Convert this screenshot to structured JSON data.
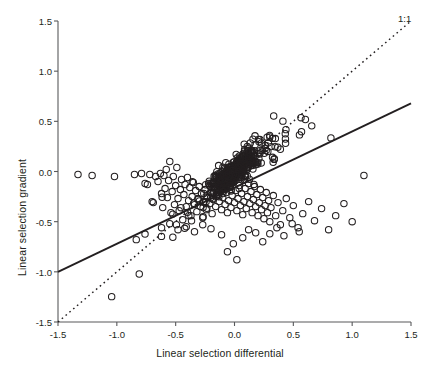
{
  "figure": {
    "background": "#ffffff",
    "ink": "#231f20",
    "axis_color": "#58595b",
    "point_stroke": "#231f20",
    "fit_line_color": "#231f20",
    "reference_line_color": "#231f20"
  },
  "annotations": {
    "one_to_one_label": "1:1"
  },
  "axes": {
    "x_label": "Linear selection differential",
    "y_label": "Linear selection gradient",
    "x_ticks": [
      "-1.5",
      "-1.0",
      "-0.5",
      "0.0",
      "0.5",
      "1.0",
      "1.5"
    ],
    "y_ticks": [
      "1.5",
      "1.0",
      "0.5",
      "0.0",
      "-0.5",
      "-1.0",
      "-1.5"
    ]
  },
  "chart_data": {
    "type": "scatter",
    "title": "",
    "xlabel": "Linear selection differential",
    "ylabel": "Linear selection gradient",
    "xlim": [
      -1.5,
      1.5
    ],
    "ylim": [
      -1.5,
      1.5
    ],
    "xticks": [
      -1.5,
      -1.0,
      -0.5,
      0.0,
      0.5,
      1.0,
      1.5
    ],
    "yticks": [
      -1.5,
      -1.0,
      -0.5,
      0.0,
      0.5,
      1.0,
      1.5
    ],
    "grid": false,
    "legend": false,
    "marker": "open-circle",
    "marker_size_px": 6.4,
    "lines": [
      {
        "name": "major-axis-fit",
        "style": "solid",
        "x": [
          -1.5,
          1.5
        ],
        "y": [
          -1.0,
          0.68
        ],
        "slope": 0.56,
        "intercept": -0.16
      },
      {
        "name": "one-to-one",
        "style": "dashed",
        "label": "1:1",
        "x": [
          -1.5,
          1.5
        ],
        "y": [
          -1.5,
          1.5
        ],
        "slope": 1.0,
        "intercept": 0.0
      }
    ],
    "n_points": 594,
    "points": [
      [
        -1.33,
        -0.03
      ],
      [
        -1.21,
        -0.04
      ],
      [
        -1.02,
        -0.05
      ],
      [
        -0.85,
        -0.03
      ],
      [
        -0.79,
        -0.02
      ],
      [
        -0.76,
        -0.12
      ],
      [
        -0.74,
        -0.13
      ],
      [
        -0.72,
        -0.03
      ],
      [
        -0.7,
        -0.3
      ],
      [
        -0.69,
        -0.31
      ],
      [
        -0.67,
        -0.05
      ],
      [
        -0.65,
        -0.1
      ],
      [
        -0.63,
        -0.02
      ],
      [
        -0.62,
        -0.22
      ],
      [
        -0.61,
        -0.36
      ],
      [
        -0.6,
        -0.04
      ],
      [
        -0.59,
        -0.17
      ],
      [
        -0.58,
        0.02
      ],
      [
        -0.57,
        -0.26
      ],
      [
        -0.56,
        -0.09
      ],
      [
        -0.55,
        0.1
      ],
      [
        -0.54,
        -0.41
      ],
      [
        -0.53,
        -0.2
      ],
      [
        -0.52,
        -0.05
      ],
      [
        -0.51,
        -0.33
      ],
      [
        -0.5,
        -0.14
      ],
      [
        -0.49,
        0.04
      ],
      [
        -0.48,
        -0.27
      ],
      [
        -0.47,
        -0.39
      ],
      [
        -0.46,
        -0.18
      ],
      [
        -0.45,
        -0.08
      ],
      [
        -0.44,
        -0.48
      ],
      [
        -0.43,
        -0.23
      ],
      [
        -0.42,
        -0.13
      ],
      [
        -0.41,
        -0.35
      ],
      [
        -0.4,
        -0.06
      ],
      [
        -0.39,
        -0.29
      ],
      [
        -0.38,
        -0.16
      ],
      [
        -0.37,
        -0.44
      ],
      [
        -0.36,
        -0.25
      ],
      [
        -0.35,
        -0.11
      ],
      [
        -0.34,
        -0.33
      ],
      [
        -0.33,
        -0.19
      ],
      [
        -0.32,
        -0.4
      ],
      [
        -0.31,
        -0.27
      ],
      [
        -0.3,
        -0.15
      ],
      [
        -0.29,
        -0.35
      ],
      [
        -0.28,
        -0.22
      ],
      [
        -0.27,
        -0.46
      ],
      [
        -0.26,
        -0.3
      ],
      [
        -0.25,
        -0.18
      ],
      [
        -0.24,
        -0.38
      ],
      [
        -0.23,
        -0.26
      ],
      [
        -0.22,
        -0.12
      ],
      [
        -0.21,
        -0.32
      ],
      [
        -0.2,
        -0.21
      ],
      [
        -0.19,
        -0.42
      ],
      [
        -0.18,
        -0.28
      ],
      [
        -0.17,
        -0.15
      ],
      [
        -0.16,
        -0.35
      ],
      [
        -0.15,
        -0.23
      ],
      [
        -0.14,
        -0.09
      ],
      [
        -0.13,
        -0.3
      ],
      [
        -0.12,
        -0.19
      ],
      [
        -0.11,
        -0.38
      ],
      [
        -0.1,
        -0.26
      ],
      [
        -0.09,
        -0.13
      ],
      [
        -0.08,
        -0.33
      ],
      [
        -0.07,
        -0.21
      ],
      [
        -0.06,
        -0.41
      ],
      [
        -0.05,
        -0.29
      ],
      [
        -0.04,
        -0.16
      ],
      [
        -0.03,
        -0.36
      ],
      [
        -0.02,
        -0.24
      ],
      [
        -0.01,
        -0.11
      ],
      [
        0.0,
        -0.31
      ],
      [
        0.01,
        -0.19
      ],
      [
        0.02,
        -0.39
      ],
      [
        0.03,
        -0.27
      ],
      [
        0.04,
        -0.14
      ],
      [
        0.05,
        -0.34
      ],
      [
        0.06,
        -0.22
      ],
      [
        0.07,
        -0.43
      ],
      [
        0.08,
        -0.3
      ],
      [
        0.09,
        -0.17
      ],
      [
        0.1,
        -0.37
      ],
      [
        0.11,
        -0.25
      ],
      [
        0.12,
        -0.12
      ],
      [
        0.13,
        -0.32
      ],
      [
        0.14,
        -0.2
      ],
      [
        0.15,
        -0.41
      ],
      [
        0.16,
        -0.28
      ],
      [
        0.17,
        -0.15
      ],
      [
        0.18,
        -0.35
      ],
      [
        0.19,
        -0.23
      ],
      [
        0.2,
        -0.44
      ],
      [
        0.21,
        -0.31
      ],
      [
        0.22,
        -0.18
      ],
      [
        0.23,
        -0.38
      ],
      [
        0.24,
        -0.26
      ],
      [
        0.25,
        -0.47
      ],
      [
        0.26,
        -0.34
      ],
      [
        0.27,
        -0.21
      ],
      [
        0.28,
        -0.41
      ],
      [
        0.29,
        -0.29
      ],
      [
        0.3,
        -0.5
      ],
      [
        0.31,
        -0.36
      ],
      [
        0.33,
        -0.24
      ],
      [
        0.35,
        -0.44
      ],
      [
        0.37,
        -0.31
      ],
      [
        0.39,
        -0.53
      ],
      [
        0.41,
        -0.39
      ],
      [
        0.44,
        -0.27
      ],
      [
        0.47,
        -0.46
      ],
      [
        0.5,
        -0.34
      ],
      [
        0.54,
        -0.56
      ],
      [
        0.58,
        -0.42
      ],
      [
        0.63,
        -0.3
      ],
      [
        0.68,
        -0.49
      ],
      [
        0.74,
        -0.37
      ],
      [
        0.8,
        -0.58
      ],
      [
        0.86,
        -0.44
      ],
      [
        0.93,
        -0.32
      ],
      [
        1.0,
        -0.5
      ],
      [
        1.1,
        -0.04
      ],
      [
        -0.06,
        -0.8
      ],
      [
        0.02,
        -0.88
      ],
      [
        -0.01,
        -0.72
      ],
      [
        0.07,
        -0.66
      ],
      [
        0.24,
        -0.7
      ],
      [
        0.18,
        -0.61
      ],
      [
        -0.11,
        -0.63
      ],
      [
        0.12,
        -0.58
      ],
      [
        0.3,
        -0.62
      ],
      [
        0.36,
        -0.56
      ],
      [
        0.42,
        -0.64
      ],
      [
        0.49,
        -0.52
      ],
      [
        0.55,
        -0.6
      ],
      [
        -0.2,
        -0.57
      ],
      [
        -0.27,
        -0.53
      ],
      [
        -0.34,
        -0.6
      ],
      [
        -0.41,
        -0.55
      ],
      [
        -0.48,
        -0.58
      ],
      [
        -0.55,
        -0.52
      ],
      [
        -0.62,
        -0.56
      ]
    ]
  }
}
